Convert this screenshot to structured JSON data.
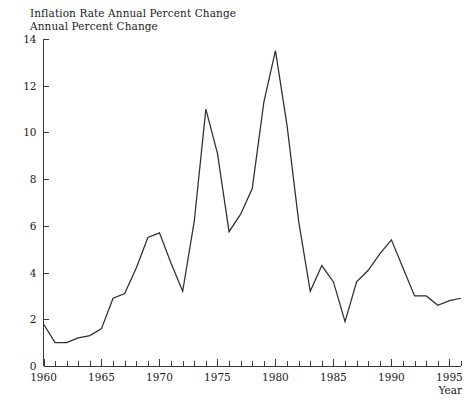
{
  "figure": {
    "title_lines": [
      "Inflation Rate",
      "Annual Percent Change"
    ],
    "background_color": "#ffffff",
    "line_color": "#2e2e2e",
    "axis_color": "#3a3a3a"
  },
  "chart_data": {
    "type": "line",
    "title": "Inflation Rate Annual Percent Change",
    "subtitle": "Annual Percent Change",
    "xlabel": "Year",
    "ylabel": "",
    "xlim": [
      1960,
      1996
    ],
    "ylim": [
      0,
      14
    ],
    "grid": false,
    "legend": "none",
    "x_major_ticks": [
      1960,
      1965,
      1970,
      1975,
      1980,
      1985,
      1990,
      1995
    ],
    "x_major_tick_labels": [
      "1960",
      "1965",
      "1970",
      "1975",
      "1980",
      "1985",
      "1990",
      "1995"
    ],
    "x_minor_tick_interval": 1,
    "y_ticks": [
      0,
      2,
      4,
      6,
      8,
      10,
      12,
      14
    ],
    "y_tick_labels": [
      "0",
      "2",
      "4",
      "6",
      "8",
      "10",
      "12",
      "14"
    ],
    "x": [
      1960,
      1961,
      1962,
      1963,
      1964,
      1965,
      1966,
      1967,
      1968,
      1969,
      1970,
      1971,
      1972,
      1973,
      1974,
      1975,
      1976,
      1977,
      1978,
      1979,
      1980,
      1981,
      1982,
      1983,
      1984,
      1985,
      1986,
      1987,
      1988,
      1989,
      1990,
      1991,
      1992,
      1993,
      1994,
      1995,
      1996
    ],
    "values": [
      1.8,
      1.0,
      1.0,
      1.2,
      1.3,
      1.6,
      2.9,
      3.1,
      4.2,
      5.5,
      5.7,
      4.4,
      3.2,
      6.2,
      11.0,
      9.1,
      5.75,
      6.5,
      7.6,
      11.3,
      13.5,
      10.3,
      6.2,
      3.2,
      4.3,
      3.6,
      1.9,
      3.6,
      4.1,
      4.8,
      5.4,
      4.2,
      3.0,
      3.0,
      2.6,
      2.8,
      2.9
    ],
    "series": [
      {
        "name": "Inflation Rate",
        "values": [
          1.8,
          1.0,
          1.0,
          1.2,
          1.3,
          1.6,
          2.9,
          3.1,
          4.2,
          5.5,
          5.7,
          4.4,
          3.2,
          6.2,
          11.0,
          9.1,
          5.75,
          6.5,
          7.6,
          11.3,
          13.5,
          10.3,
          6.2,
          3.2,
          4.3,
          3.6,
          1.9,
          3.6,
          4.1,
          4.8,
          5.4,
          4.2,
          3.0,
          3.0,
          2.6,
          2.8,
          2.9
        ]
      }
    ]
  }
}
